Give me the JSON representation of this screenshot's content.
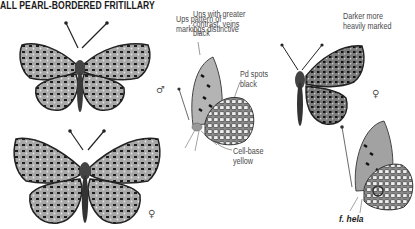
{
  "page": {
    "title": "ALL PEARL-BORDERED FRITILLARY",
    "annotations": [
      {
        "id": "ups-pattern",
        "text_lines": [
          "Ups pattern of",
          "markings distinctive"
        ]
      },
      {
        "id": "uns-contrast",
        "text_lines": [
          "Uns with greater",
          "contrast, veins",
          "black"
        ]
      },
      {
        "id": "pd-spots",
        "text_lines": [
          "Pd spots",
          "black"
        ]
      },
      {
        "id": "cell-base",
        "text_lines": [
          "Cell-base",
          "yellow"
        ]
      },
      {
        "id": "darker",
        "text_lines": [
          "Darker more",
          "heavily marked"
        ]
      }
    ],
    "sex_symbols": {
      "male": "♂",
      "female_1": "♀",
      "female_2": "♀"
    },
    "caption": "f. hela",
    "colors": {
      "ink": "#2a2a2a",
      "wing_fill": "#9a9a9a",
      "pale_spot": "#e8e8e8"
    }
  }
}
